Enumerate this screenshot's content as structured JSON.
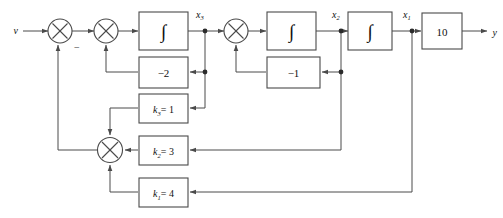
{
  "diagram": {
    "type": "control-system-block-diagram",
    "colors": {
      "line": "#4a4a4a",
      "text": "#111111",
      "background": "#ffffff"
    },
    "signals": {
      "input": "v",
      "output": "y",
      "state_x3": "x",
      "state_x3_sub": "3",
      "state_x2": "x",
      "state_x2_sub": "2",
      "state_x1": "x",
      "state_x1_sub": "1"
    },
    "summing_junctions": [
      {
        "name": "sum-input",
        "symbol": "✕",
        "sign_label": "−"
      },
      {
        "name": "sum-second",
        "symbol": "✕",
        "sign_label": ""
      },
      {
        "name": "sum-third",
        "symbol": "✕",
        "sign_label": ""
      },
      {
        "name": "sum-feedback",
        "symbol": "✕",
        "sign_label": ""
      }
    ],
    "integrators": [
      {
        "name": "integrator-1",
        "label": "∫"
      },
      {
        "name": "integrator-2",
        "label": "∫"
      },
      {
        "name": "integrator-3",
        "label": "∫"
      }
    ],
    "gain_blocks": [
      {
        "name": "gain-minus-2",
        "label": "−2",
        "value": -2
      },
      {
        "name": "gain-minus-1",
        "label": "−1",
        "value": -1
      },
      {
        "name": "gain-k3",
        "symbol": "k",
        "subscript": "3",
        "eq": "= 1",
        "value": 1
      },
      {
        "name": "gain-k2",
        "symbol": "k",
        "subscript": "2",
        "eq": "= 3",
        "value": 3
      },
      {
        "name": "gain-k1",
        "symbol": "k",
        "subscript": "1",
        "eq": "= 4",
        "value": 4
      },
      {
        "name": "gain-output",
        "label": "10",
        "value": 10
      }
    ]
  }
}
